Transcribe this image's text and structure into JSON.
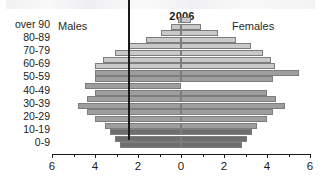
{
  "chart_data": {
    "type": "bar",
    "subtype": "population-pyramid",
    "title": "2006",
    "xlabel": "",
    "ylabel": "",
    "xlim": [
      -6,
      6
    ],
    "xticks": [
      6,
      4,
      2,
      0,
      2,
      4,
      6
    ],
    "xtick_values": [
      -6,
      -4,
      -2,
      0,
      2,
      4,
      6
    ],
    "minor_tick_step": 1,
    "grid": false,
    "legend_position": "inline-top",
    "legend": [
      "Males",
      "Females"
    ],
    "categories": [
      "over 90",
      "80-89",
      "70-79",
      "60-69",
      "50-59",
      "40-49",
      "30-39",
      "20-29",
      "10-19",
      "0-9"
    ],
    "bands": [
      {
        "age": "95+",
        "group": "over 90",
        "males": 0.15,
        "females": 0.45,
        "shade": "light"
      },
      {
        "age": "90-94",
        "group": "over 90",
        "males": 0.45,
        "females": 0.95,
        "shade": "light"
      },
      {
        "age": "85-89",
        "group": "80-89",
        "males": 0.95,
        "females": 1.7,
        "shade": "light"
      },
      {
        "age": "80-84",
        "group": "80-89",
        "males": 1.65,
        "females": 2.55,
        "shade": "light"
      },
      {
        "age": "75-79",
        "group": "70-79",
        "males": 2.4,
        "females": 3.25,
        "shade": "light"
      },
      {
        "age": "70-74",
        "group": "70-79",
        "males": 3.05,
        "females": 3.8,
        "shade": "light"
      },
      {
        "age": "65-69",
        "group": "60-69",
        "males": 3.65,
        "females": 4.2,
        "shade": "light"
      },
      {
        "age": "60-64",
        "group": "60-69",
        "males": 4.0,
        "females": 4.35,
        "shade": "light"
      },
      {
        "age": "55-59",
        "group": "50-59",
        "males": 4.0,
        "females": 5.5,
        "shade": "mid"
      },
      {
        "age": "50-54",
        "group": "50-59",
        "males": 4.0,
        "females": 4.3,
        "shade": "mid"
      },
      {
        "age": "45-49",
        "group": "40-49",
        "males": 4.45,
        "females": 0.0,
        "shade": "mid"
      },
      {
        "age": "40-44",
        "group": "40-49",
        "males": 4.0,
        "females": 4.0,
        "shade": "mid"
      },
      {
        "age": "35-39",
        "group": "30-39",
        "males": 4.35,
        "females": 4.4,
        "shade": "mid"
      },
      {
        "age": "30-34",
        "group": "30-39",
        "males": 4.8,
        "females": 4.85,
        "shade": "mid"
      },
      {
        "age": "25-29",
        "group": "20-29",
        "males": 4.35,
        "females": 4.3,
        "shade": "mid"
      },
      {
        "age": "20-24",
        "group": "20-29",
        "males": 4.0,
        "females": 4.0,
        "shade": "mid"
      },
      {
        "age": "15-19",
        "group": "10-19",
        "males": 3.55,
        "females": 3.55,
        "shade": "mid"
      },
      {
        "age": "10-14",
        "group": "10-19",
        "males": 3.3,
        "females": 3.3,
        "shade": "dark"
      },
      {
        "age": "5-9",
        "group": "0-9",
        "males": 3.05,
        "females": 3.05,
        "shade": "dark"
      },
      {
        "age": "0-4",
        "group": "0-9",
        "males": 2.85,
        "females": 2.85,
        "shade": "dark"
      }
    ],
    "colors": {
      "light": "#c9c9c9",
      "mid": "#9e9e9e",
      "dark": "#6e6e6e",
      "outline": "#7d7d7d",
      "axis": "#1a1a1a",
      "text": "#1b1b1b",
      "background": "#ffffff"
    }
  },
  "labels": {
    "year": "2006",
    "males": "Males",
    "females": "Females"
  }
}
